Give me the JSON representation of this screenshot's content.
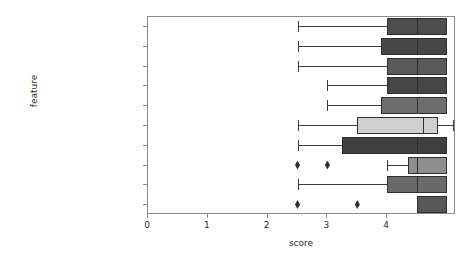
{
  "chart_data": {
    "type": "box",
    "title": "",
    "xlabel": "score",
    "ylabel": "feature",
    "xlim": [
      0,
      5.15
    ],
    "xticks": [
      0,
      1,
      2,
      3,
      4
    ],
    "xticklabels": [
      "0",
      "1",
      "2",
      "3",
      "4"
    ],
    "grid": false,
    "legend": null,
    "orientation": "horizontal",
    "categories": [
      "Data Security",
      "Lab Instrument Interface",
      "Multi-Location Printing",
      "Online Instrumentation",
      "Procedure-Based Billing",
      "Sample Tracking",
      "Data Analysis Auditing",
      "EMR Interface",
      "Fax Management",
      "Physician Test Panels"
    ],
    "boxes": [
      {
        "label": "Data Security",
        "whisker_low": 2.5,
        "q1": 4.0,
        "median": 4.5,
        "q3": 5.0,
        "whisker_high": 5.0,
        "fliers": [],
        "color": "#4d4d4d"
      },
      {
        "label": "Lab Instrument Interface",
        "whisker_low": 2.5,
        "q1": 3.9,
        "median": 4.5,
        "q3": 5.0,
        "whisker_high": 5.0,
        "fliers": [],
        "color": "#474747"
      },
      {
        "label": "Multi-Location Printing",
        "whisker_low": 2.5,
        "q1": 4.0,
        "median": 4.5,
        "q3": 5.0,
        "whisker_high": 5.0,
        "fliers": [],
        "color": "#5a5a5a"
      },
      {
        "label": "Online Instrumentation",
        "whisker_low": 3.0,
        "q1": 4.0,
        "median": 4.5,
        "q3": 5.0,
        "whisker_high": 5.0,
        "fliers": [],
        "color": "#464646"
      },
      {
        "label": "Procedure-Based Billing",
        "whisker_low": 3.0,
        "q1": 3.9,
        "median": 4.5,
        "q3": 5.0,
        "whisker_high": 5.0,
        "fliers": [],
        "color": "#6e6e6e"
      },
      {
        "label": "Sample Tracking",
        "whisker_low": 2.5,
        "q1": 3.5,
        "median": 4.6,
        "q3": 4.85,
        "whisker_high": 5.1,
        "fliers": [],
        "color": "#cfcfcf"
      },
      {
        "label": "Data Analysis Auditing",
        "whisker_low": 2.5,
        "q1": 3.25,
        "median": 4.5,
        "q3": 5.0,
        "whisker_high": 5.0,
        "fliers": [],
        "color": "#3f3f3f"
      },
      {
        "label": "EMR Interface",
        "whisker_low": 4.0,
        "q1": 4.35,
        "median": 4.5,
        "q3": 5.0,
        "whisker_high": 5.0,
        "fliers": [
          2.5,
          3.0
        ],
        "color": "#8f8f8f"
      },
      {
        "label": "Fax Management",
        "whisker_low": 2.5,
        "q1": 4.0,
        "median": 4.5,
        "q3": 5.0,
        "whisker_high": 5.0,
        "fliers": [],
        "color": "#6a6a6a"
      },
      {
        "label": "Physician Test Panels",
        "whisker_low": 4.5,
        "q1": 4.5,
        "median": 5.0,
        "q3": 5.0,
        "whisker_high": 5.0,
        "fliers": [
          2.5,
          3.5
        ],
        "color": "#575757"
      }
    ]
  },
  "axes": {
    "xlabel": "score",
    "ylabel": "feature",
    "axis_color": "#8a8a8a",
    "tick_label_color": "#2b2b2b"
  }
}
